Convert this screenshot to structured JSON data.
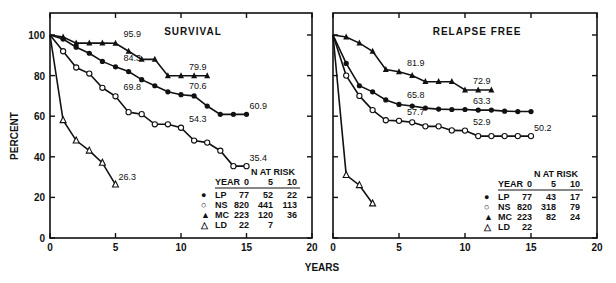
{
  "chart_data": [
    {
      "type": "line",
      "title": "SURVIVAL",
      "xlabel": "YEARS",
      "ylabel": "PERCENT",
      "xlim": [
        0,
        20
      ],
      "ylim": [
        0,
        100
      ],
      "x_ticks": [
        "0",
        "5",
        "10",
        "15",
        "20"
      ],
      "y_ticks": [
        "0",
        "20",
        "40",
        "60",
        "80",
        "100"
      ],
      "grid": false,
      "series": [
        {
          "name": "MC",
          "marker": "filled-triangle",
          "points": [
            [
              0,
              100
            ],
            [
              1,
              99
            ],
            [
              2,
              96
            ],
            [
              3,
              96
            ],
            [
              4,
              96
            ],
            [
              5,
              95.9
            ],
            [
              6,
              92
            ],
            [
              7,
              88
            ],
            [
              8,
              88
            ],
            [
              9,
              79.9
            ],
            [
              10,
              79.9
            ],
            [
              11,
              79.9
            ],
            [
              12,
              79.9
            ]
          ]
        },
        {
          "name": "LP",
          "marker": "filled-circle",
          "points": [
            [
              0,
              100
            ],
            [
              1,
              98
            ],
            [
              2,
              94
            ],
            [
              3,
              91
            ],
            [
              4,
              87
            ],
            [
              5,
              84.3
            ],
            [
              6,
              82
            ],
            [
              7,
              78
            ],
            [
              8,
              75
            ],
            [
              9,
              72
            ],
            [
              10,
              70.6
            ],
            [
              11,
              70
            ],
            [
              12,
              65
            ],
            [
              13,
              60.9
            ],
            [
              14,
              60.9
            ],
            [
              15,
              60.9
            ]
          ]
        },
        {
          "name": "NS",
          "marker": "open-circle",
          "points": [
            [
              0,
              100
            ],
            [
              1,
              92
            ],
            [
              2,
              84
            ],
            [
              3,
              81
            ],
            [
              4,
              74
            ],
            [
              5,
              69.8
            ],
            [
              6,
              62
            ],
            [
              7,
              61
            ],
            [
              8,
              56
            ],
            [
              9,
              56
            ],
            [
              10,
              54.3
            ],
            [
              11,
              48
            ],
            [
              12,
              47
            ],
            [
              13,
              43
            ],
            [
              14,
              35.4
            ],
            [
              15,
              35.4
            ]
          ]
        },
        {
          "name": "LD",
          "marker": "open-triangle",
          "points": [
            [
              0,
              100
            ],
            [
              1,
              58
            ],
            [
              2,
              48
            ],
            [
              3,
              43
            ],
            [
              4,
              37
            ],
            [
              5,
              26.3
            ]
          ]
        }
      ],
      "annotations": [
        {
          "text": "95.9",
          "x": 5,
          "y": 95.9
        },
        {
          "text": "84.3",
          "x": 5,
          "y": 84.3
        },
        {
          "text": "69.8",
          "x": 5,
          "y": 69.8
        },
        {
          "text": "79.9",
          "x": 10,
          "y": 79.9
        },
        {
          "text": "70.6",
          "x": 10,
          "y": 70.6
        },
        {
          "text": "54.3",
          "x": 10,
          "y": 54.3
        },
        {
          "text": "60.9",
          "x": 15,
          "y": 60.9
        },
        {
          "text": "35.4",
          "x": 15,
          "y": 35.4
        },
        {
          "text": "26.3",
          "x": 5,
          "y": 26.3
        }
      ],
      "risk_table": {
        "header": "N AT RISK",
        "columns": [
          "YEAR",
          "0",
          "5",
          "10"
        ],
        "rows": [
          {
            "group": "LP",
            "marker": "●",
            "values": [
              "77",
              "52",
              "22"
            ]
          },
          {
            "group": "NS",
            "marker": "○",
            "values": [
              "820",
              "441",
              "113"
            ]
          },
          {
            "group": "MC",
            "marker": "▲",
            "values": [
              "223",
              "120",
              "36"
            ]
          },
          {
            "group": "LD",
            "marker": "△",
            "values": [
              "22",
              "7",
              ""
            ]
          }
        ]
      }
    },
    {
      "type": "line",
      "title": "RELAPSE FREE",
      "xlabel": "YEARS",
      "ylabel": "PERCENT",
      "xlim": [
        0,
        20
      ],
      "ylim": [
        0,
        100
      ],
      "x_ticks": [
        "0",
        "5",
        "10",
        "15",
        "20"
      ],
      "y_ticks": [
        "0",
        "20",
        "40",
        "60",
        "80",
        "100"
      ],
      "grid": false,
      "series": [
        {
          "name": "MC",
          "marker": "filled-triangle",
          "points": [
            [
              0,
              100
            ],
            [
              1,
              99
            ],
            [
              2,
              96
            ],
            [
              3,
              92
            ],
            [
              4,
              83
            ],
            [
              5,
              81.9
            ],
            [
              6,
              80
            ],
            [
              7,
              77
            ],
            [
              8,
              77
            ],
            [
              9,
              77
            ],
            [
              10,
              72.9
            ],
            [
              11,
              72.9
            ],
            [
              12,
              72.9
            ]
          ]
        },
        {
          "name": "LP",
          "marker": "filled-circle",
          "points": [
            [
              0,
              100
            ],
            [
              1,
              86
            ],
            [
              2,
              75
            ],
            [
              3,
              72
            ],
            [
              4,
              68
            ],
            [
              5,
              65.8
            ],
            [
              6,
              65
            ],
            [
              7,
              64
            ],
            [
              8,
              63.5
            ],
            [
              9,
              63.3
            ],
            [
              10,
              63.3
            ],
            [
              11,
              63
            ],
            [
              12,
              63
            ],
            [
              13,
              62.5
            ],
            [
              14,
              62.3
            ],
            [
              15,
              62.3
            ]
          ]
        },
        {
          "name": "NS",
          "marker": "open-circle",
          "points": [
            [
              0,
              100
            ],
            [
              1,
              80
            ],
            [
              2,
              70
            ],
            [
              3,
              63
            ],
            [
              4,
              58
            ],
            [
              5,
              57.7
            ],
            [
              6,
              57
            ],
            [
              7,
              55
            ],
            [
              8,
              55
            ],
            [
              9,
              53
            ],
            [
              10,
              52.9
            ],
            [
              11,
              50.2
            ],
            [
              12,
              50.2
            ],
            [
              13,
              50.2
            ],
            [
              14,
              50.2
            ],
            [
              15,
              50.2
            ]
          ]
        },
        {
          "name": "LD",
          "marker": "open-triangle",
          "points": [
            [
              0,
              100
            ],
            [
              1,
              31
            ],
            [
              2,
              26
            ],
            [
              3,
              17
            ]
          ]
        }
      ],
      "annotations": [
        {
          "text": "81.9",
          "x": 5,
          "y": 81.9
        },
        {
          "text": "65.8",
          "x": 5,
          "y": 65.8
        },
        {
          "text": "57.7",
          "x": 5,
          "y": 57.7
        },
        {
          "text": "72.9",
          "x": 10,
          "y": 72.9
        },
        {
          "text": "63.3",
          "x": 10,
          "y": 63.3
        },
        {
          "text": "52.9",
          "x": 10,
          "y": 52.9
        },
        {
          "text": "50.2",
          "x": 15,
          "y": 50.2
        }
      ],
      "risk_table": {
        "header": "N AT RISK",
        "columns": [
          "YEAR",
          "0",
          "5",
          "10"
        ],
        "rows": [
          {
            "group": "LP",
            "marker": "●",
            "values": [
              "77",
              "43",
              "17"
            ]
          },
          {
            "group": "NS",
            "marker": "○",
            "values": [
              "820",
              "318",
              "79"
            ]
          },
          {
            "group": "MC",
            "marker": "▲",
            "values": [
              "223",
              "82",
              "24"
            ]
          },
          {
            "group": "LD",
            "marker": "△",
            "values": [
              "22",
              "",
              ""
            ]
          }
        ]
      }
    }
  ],
  "labels": {
    "ylabel": "PERCENT",
    "xlabel": "YEARS",
    "left_title": "SURVIVAL",
    "right_title": "RELAPSE FREE"
  }
}
